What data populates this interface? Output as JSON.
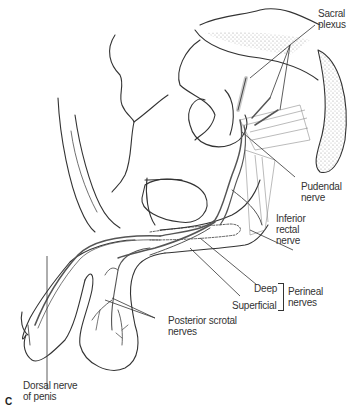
{
  "figure": {
    "panel_letter": "C",
    "labels": {
      "sacral_plexus": [
        "Sacral",
        "plexus"
      ],
      "pudendal_nerve": [
        "Pudendal",
        "nerve"
      ],
      "inferior_rectal_nerve": [
        "Inferior",
        "rectal",
        "nerve"
      ],
      "deep": "Deep",
      "superficial": "Superficial",
      "perineal_nerves": [
        "Perineal",
        "nerves"
      ],
      "posterior_scrotal_nerves": [
        "Posterior scrotal",
        "nerves"
      ],
      "dorsal_nerve_of_penis": [
        "Dorsal nerve",
        "of penis"
      ]
    },
    "colors": {
      "outline": "#333333",
      "nerve": "#555555",
      "stipple": "#9a9a9a",
      "background": "#ffffff"
    }
  }
}
